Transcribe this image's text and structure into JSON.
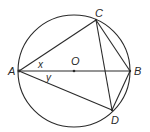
{
  "diagram": {
    "type": "circle-geometry",
    "circle": {
      "center": "O",
      "cx": 74,
      "cy": 71,
      "r": 56
    },
    "points": {
      "A": {
        "label": "A",
        "x": 19,
        "y": 71
      },
      "B": {
        "label": "B",
        "x": 130,
        "y": 71
      },
      "C": {
        "label": "C",
        "x": 96,
        "y": 20
      },
      "D": {
        "label": "D",
        "x": 112,
        "y": 110
      },
      "O": {
        "label": "O",
        "x": 74,
        "y": 71
      }
    },
    "segments": [
      "AB",
      "AC",
      "AD",
      "CB",
      "CD",
      "BD"
    ],
    "angles": {
      "x": {
        "label": "x",
        "between": "CAB"
      },
      "y": {
        "label": "y",
        "between": "BAD"
      }
    },
    "stroke_color": "#2a2a2a"
  }
}
